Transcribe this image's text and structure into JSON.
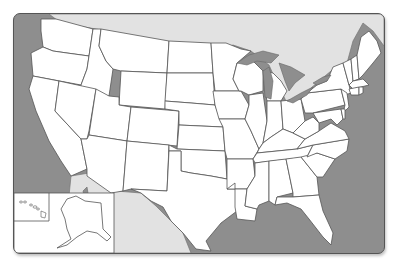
{
  "map": {
    "title": "",
    "type": "blank outline map",
    "region": "United States",
    "labels": [],
    "colors": {
      "ocean": "#8e8e8e",
      "land_us": "#ffffff",
      "land_foreign": "#e2e2e2",
      "border": "#555555",
      "page_background": "#ffffff"
    },
    "insets": [
      "Alaska",
      "Hawaii"
    ]
  }
}
